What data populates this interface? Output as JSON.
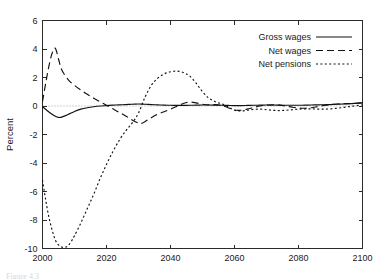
{
  "figure": {
    "caption_partial": "Figure 4.3"
  },
  "chart_data": {
    "type": "line",
    "title": "",
    "xlabel": "",
    "ylabel": "Percent",
    "xlim": [
      2000,
      2100
    ],
    "ylim": [
      -10,
      6
    ],
    "xticks": [
      2000,
      2020,
      2040,
      2060,
      2080,
      2100
    ],
    "xtick_labels": [
      "2000",
      "2020",
      "2040",
      "2060",
      "2080",
      "2100"
    ],
    "yticks": [
      6,
      4,
      2,
      0,
      -2,
      -4,
      -6,
      -8,
      -10
    ],
    "ytick_labels": [
      "6",
      "4",
      "2",
      "0",
      "-2",
      "-4",
      "-6",
      "-8",
      "-10"
    ],
    "grid": false,
    "zero_reference_line": true,
    "legend_position": "top-right",
    "series": [
      {
        "name": "Gross wages",
        "line_style": "solid",
        "color": "#111111",
        "x": [
          2000,
          2002,
          2004,
          2005,
          2006,
          2008,
          2010,
          2012,
          2014,
          2016,
          2018,
          2020,
          2022,
          2024,
          2026,
          2028,
          2030,
          2032,
          2034,
          2036,
          2038,
          2040,
          2042,
          2044,
          2046,
          2048,
          2050,
          2052,
          2054,
          2056,
          2058,
          2060,
          2062,
          2064,
          2066,
          2068,
          2070,
          2072,
          2074,
          2076,
          2078,
          2080,
          2082,
          2084,
          2086,
          2088,
          2090,
          2092,
          2094,
          2096,
          2098,
          2100
        ],
        "values": [
          -0.05,
          -0.42,
          -0.72,
          -0.8,
          -0.78,
          -0.6,
          -0.38,
          -0.22,
          -0.12,
          -0.05,
          0.0,
          0.03,
          0.06,
          0.08,
          0.1,
          0.12,
          0.14,
          0.12,
          0.1,
          0.08,
          0.06,
          0.05,
          0.04,
          0.04,
          0.05,
          0.06,
          0.07,
          0.07,
          0.06,
          0.05,
          0.04,
          0.03,
          0.03,
          0.04,
          0.05,
          0.06,
          0.07,
          0.07,
          0.06,
          0.05,
          0.05,
          0.05,
          0.06,
          0.07,
          0.08,
          0.09,
          0.1,
          0.12,
          0.14,
          0.16,
          0.19,
          0.22
        ]
      },
      {
        "name": "Net wages",
        "line_style": "dashed",
        "color": "#111111",
        "x": [
          2000,
          2001,
          2002,
          2003,
          2004,
          2005,
          2006,
          2008,
          2010,
          2012,
          2014,
          2016,
          2018,
          2020,
          2022,
          2024,
          2026,
          2028,
          2030,
          2031,
          2032,
          2034,
          2036,
          2038,
          2040,
          2042,
          2044,
          2046,
          2048,
          2050,
          2052,
          2054,
          2056,
          2058,
          2060,
          2062,
          2064,
          2066,
          2068,
          2070,
          2072,
          2074,
          2076,
          2078,
          2080,
          2082,
          2084,
          2086,
          2088,
          2090,
          2092,
          2094,
          2096,
          2098,
          2100
        ],
        "values": [
          0.3,
          1.6,
          2.8,
          3.7,
          4.05,
          3.3,
          2.55,
          1.85,
          1.45,
          1.12,
          0.82,
          0.55,
          0.3,
          0.05,
          -0.2,
          -0.45,
          -0.7,
          -0.98,
          -1.2,
          -1.22,
          -1.1,
          -0.82,
          -0.58,
          -0.4,
          -0.22,
          -0.02,
          0.18,
          0.28,
          0.22,
          0.12,
          0.08,
          0.1,
          0.05,
          -0.12,
          -0.28,
          -0.3,
          -0.22,
          -0.1,
          0.0,
          0.06,
          0.08,
          0.06,
          0.0,
          -0.08,
          -0.14,
          -0.16,
          -0.12,
          -0.04,
          0.04,
          0.1,
          0.14,
          0.16,
          0.17,
          0.19,
          0.22
        ]
      },
      {
        "name": "Net pensions",
        "line_style": "dotted",
        "color": "#111111",
        "x": [
          2000,
          2001,
          2002,
          2003,
          2004,
          2005,
          2006,
          2007,
          2008,
          2009,
          2010,
          2012,
          2014,
          2016,
          2018,
          2020,
          2022,
          2024,
          2026,
          2028,
          2030,
          2032,
          2034,
          2036,
          2038,
          2040,
          2042,
          2044,
          2046,
          2048,
          2050,
          2052,
          2054,
          2056,
          2058,
          2060,
          2062,
          2064,
          2066,
          2068,
          2070,
          2072,
          2074,
          2076,
          2078,
          2080,
          2082,
          2084,
          2086,
          2088,
          2090,
          2092,
          2094,
          2096,
          2098,
          2100
        ],
        "values": [
          -5.2,
          -6.6,
          -7.8,
          -8.7,
          -9.4,
          -9.75,
          -9.9,
          -9.92,
          -9.8,
          -9.5,
          -9.1,
          -8.2,
          -7.2,
          -6.2,
          -5.1,
          -4.1,
          -3.2,
          -2.4,
          -1.75,
          -1.2,
          -0.5,
          0.6,
          1.45,
          1.95,
          2.25,
          2.4,
          2.45,
          2.35,
          2.1,
          1.6,
          1.0,
          0.55,
          0.3,
          0.15,
          -0.05,
          -0.3,
          -0.35,
          -0.3,
          -0.24,
          -0.22,
          -0.26,
          -0.3,
          -0.32,
          -0.3,
          -0.26,
          -0.22,
          -0.2,
          -0.2,
          -0.22,
          -0.22,
          -0.2,
          -0.16,
          -0.1,
          -0.04,
          0.02,
          0.08
        ]
      }
    ]
  }
}
